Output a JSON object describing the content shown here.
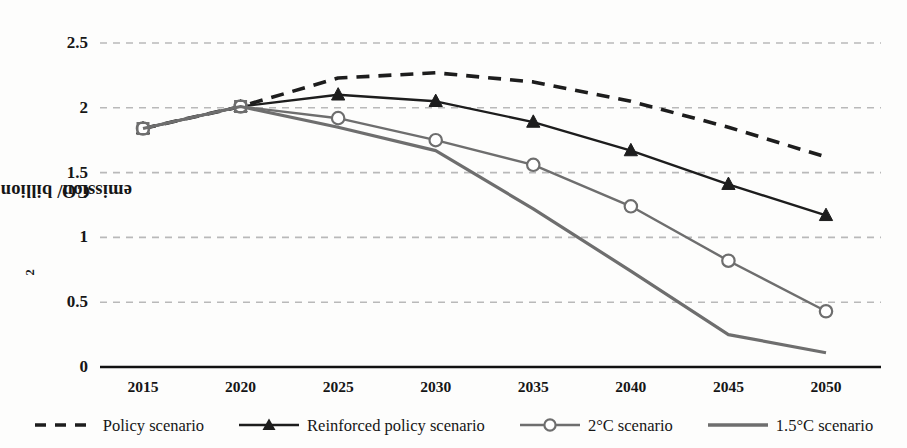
{
  "chart_data": {
    "type": "line",
    "title": "",
    "xlabel": "",
    "ylabel": "CO2 emission/ billion tons",
    "ylabel_prefix": "CO",
    "ylabel_sub": "2",
    "ylabel_suffix": " emission/ billion tons",
    "x": [
      2015,
      2020,
      2025,
      2030,
      2035,
      2040,
      2045,
      2050
    ],
    "xtick_labels": [
      "2015",
      "2020",
      "2025",
      "2030",
      "2035",
      "2040",
      "2045",
      "2050"
    ],
    "ytick_labels": [
      "0",
      "0.5",
      "1",
      "1.5",
      "2",
      "2.5"
    ],
    "yticks": [
      0,
      0.5,
      1,
      1.5,
      2,
      2.5
    ],
    "ylim": [
      0,
      2.5
    ],
    "grid": "horizontal-dashed",
    "legend_position": "bottom",
    "series": [
      {
        "name": "Policy scenario",
        "style": "dashed",
        "marker": "none",
        "color": "#1d1d1d",
        "values": [
          1.84,
          2.01,
          2.23,
          2.27,
          2.2,
          2.05,
          1.85,
          1.62
        ]
      },
      {
        "name": "Reinforced policy scenario",
        "style": "solid",
        "marker": "triangle",
        "color": "#1d1d1d",
        "values": [
          1.84,
          2.01,
          2.1,
          2.05,
          1.89,
          1.67,
          1.41,
          1.17
        ]
      },
      {
        "name": "2°C scenario",
        "style": "solid",
        "marker": "circle",
        "color": "#6e6e6e",
        "values": [
          1.84,
          2.01,
          1.92,
          1.75,
          1.56,
          1.24,
          0.82,
          0.43
        ]
      },
      {
        "name": "1.5°C scenario",
        "style": "solid",
        "marker": "none",
        "color": "#6e6e6e",
        "values": [
          1.84,
          2.01,
          1.85,
          1.67,
          1.22,
          0.74,
          0.25,
          0.11
        ]
      }
    ]
  },
  "legend": {
    "items": [
      {
        "label": "Policy scenario"
      },
      {
        "label": "Reinforced policy scenario"
      },
      {
        "label": "2°C scenario"
      },
      {
        "label": "1.5°C scenario"
      }
    ]
  }
}
